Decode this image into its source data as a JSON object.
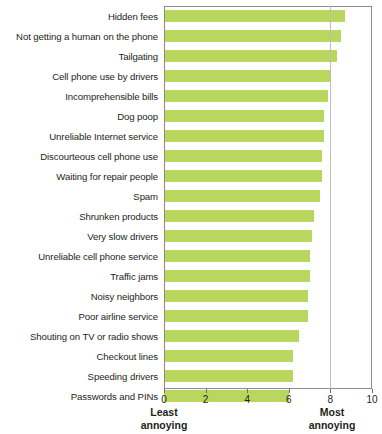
{
  "chart": {
    "type": "bar-horizontal",
    "axis": {
      "ticks": [
        "0",
        "2",
        "4",
        "6",
        "8",
        "10"
      ],
      "min": 0,
      "max": 10,
      "gridline_at": 8
    },
    "endcaps": {
      "left_line1": "Least",
      "left_line2": "annoying",
      "right_line1": "Most",
      "right_line2": "annoying"
    },
    "bar_color": "#b9d75e",
    "frame_color": "#8d8d8d",
    "grid_color": "#bdbdbd"
  },
  "chart_data": {
    "type": "bar",
    "title": "",
    "subtitle": "",
    "xlabel": "",
    "ylabel": "",
    "xlim": [
      0,
      10
    ],
    "grid": true,
    "legend": "none",
    "orientation": "horizontal",
    "categories": [
      "Hidden fees",
      "Not getting a human on the phone",
      "Tailgating",
      "Cell phone use by drivers",
      "Incomprehensible bills",
      "Dog poop",
      "Unreliable Internet service",
      "Discourteous cell phone use",
      "Waiting for repair people",
      "Spam",
      "Shrunken products",
      "Very slow drivers",
      "Unreliable cell phone service",
      "Traffic jams",
      "Noisy neighbors",
      "Poor airline service",
      "Shouting on TV or radio shows",
      "Checkout lines",
      "Speeding drivers",
      "Passwords and PINs"
    ],
    "values": [
      8.7,
      8.5,
      8.3,
      8.0,
      7.9,
      7.7,
      7.7,
      7.6,
      7.6,
      7.5,
      7.2,
      7.1,
      7.0,
      7.0,
      6.9,
      6.9,
      6.5,
      6.2,
      6.2,
      6.0
    ]
  }
}
